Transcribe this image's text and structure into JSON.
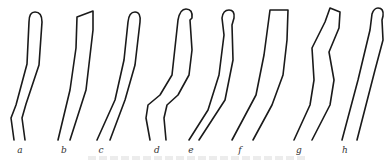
{
  "figure": {
    "type": "line-drawing of eight tubular outlines",
    "stroke_color": "#1a1a1a",
    "labels": [
      "a",
      "b",
      "c",
      "d",
      "e",
      "f",
      "g",
      "h"
    ],
    "caption": ""
  }
}
